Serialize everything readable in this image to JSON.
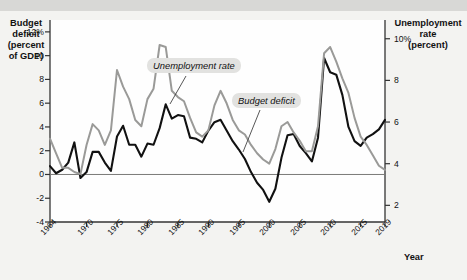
{
  "figure": {
    "top_clipped_text": "",
    "xaxis_title": "Year",
    "left_axis_title_lines": [
      "Budget",
      "deficit",
      "(percent",
      "of GDP)"
    ],
    "right_axis_title_lines": [
      "Unemployment",
      "rate",
      "(percent)"
    ]
  },
  "chart_data": {
    "type": "line",
    "title": "",
    "subtitle": "",
    "xlabel": "Year",
    "ylabel": "Budget deficit (percent of GDP)",
    "y2label": "Unemployment rate (percent)",
    "xlim": [
      1964,
      2019
    ],
    "ylim": [
      -4,
      13
    ],
    "y2lim": [
      1.2,
      10.9
    ],
    "grid": false,
    "legend_position": "inline-annotation",
    "x_ticks": [
      "1964",
      "1970",
      "1975",
      "1980",
      "1985",
      "1990",
      "1995",
      "2000",
      "2005",
      "2010",
      "2015",
      "2019"
    ],
    "x_tick_values": [
      1964,
      1970,
      1975,
      1980,
      1985,
      1990,
      1995,
      2000,
      2005,
      2010,
      2015,
      2019
    ],
    "y_ticks": [
      "12%",
      "10",
      "8",
      "6",
      "4",
      "2",
      "0",
      "-2",
      "-4"
    ],
    "y_tick_values": [
      12,
      10,
      8,
      6,
      4,
      2,
      0,
      -2,
      -4
    ],
    "y2_ticks": [
      "10%",
      "8",
      "6",
      "4",
      "2"
    ],
    "y2_tick_values": [
      10,
      8,
      6,
      4,
      2
    ],
    "annotations": [
      {
        "text": "Unemployment rate",
        "series": "unemployment_rate"
      },
      {
        "text": "Budget deficit",
        "series": "budget_deficit"
      }
    ],
    "x": [
      1964,
      1965,
      1966,
      1967,
      1968,
      1969,
      1970,
      1971,
      1972,
      1973,
      1974,
      1975,
      1976,
      1977,
      1978,
      1979,
      1980,
      1981,
      1982,
      1983,
      1984,
      1985,
      1986,
      1987,
      1988,
      1989,
      1990,
      1991,
      1992,
      1993,
      1994,
      1995,
      1996,
      1997,
      1998,
      1999,
      2000,
      2001,
      2002,
      2003,
      2004,
      2005,
      2006,
      2007,
      2008,
      2009,
      2010,
      2011,
      2012,
      2013,
      2014,
      2015,
      2016,
      2017,
      2018,
      2019
    ],
    "series": [
      {
        "name": "Budget deficit",
        "color": "#111111",
        "axis": "left",
        "unit": "percent of GDP",
        "values": [
          0.7,
          0.1,
          0.4,
          1.0,
          2.7,
          -0.3,
          0.2,
          1.9,
          1.9,
          1.0,
          0.3,
          3.2,
          4.1,
          2.5,
          2.5,
          1.5,
          2.6,
          2.5,
          3.9,
          5.9,
          4.7,
          5.0,
          4.9,
          3.1,
          3.0,
          2.7,
          3.7,
          4.4,
          4.6,
          3.7,
          2.8,
          2.1,
          1.3,
          0.2,
          -0.7,
          -1.3,
          -2.3,
          -1.2,
          1.4,
          3.3,
          3.4,
          2.4,
          1.8,
          1.1,
          3.1,
          9.8,
          8.6,
          8.4,
          6.7,
          4.0,
          2.8,
          2.4,
          3.1,
          3.4,
          3.8,
          4.6
        ]
      },
      {
        "name": "Unemployment rate",
        "color": "#9a9a98",
        "axis": "right",
        "unit": "percent",
        "values": [
          5.2,
          4.5,
          3.8,
          3.8,
          3.6,
          3.5,
          4.9,
          5.9,
          5.6,
          4.9,
          5.6,
          8.5,
          7.7,
          7.1,
          6.1,
          5.8,
          7.1,
          7.6,
          9.7,
          9.6,
          7.5,
          7.2,
          7.0,
          6.2,
          5.5,
          5.3,
          5.6,
          6.8,
          7.5,
          6.9,
          6.1,
          5.6,
          5.4,
          4.9,
          4.5,
          4.2,
          4.0,
          4.7,
          5.8,
          6.0,
          5.5,
          5.1,
          4.6,
          4.6,
          5.8,
          9.3,
          9.6,
          8.9,
          8.1,
          7.4,
          6.2,
          5.3,
          4.9,
          4.4,
          3.9,
          3.7
        ]
      }
    ]
  }
}
